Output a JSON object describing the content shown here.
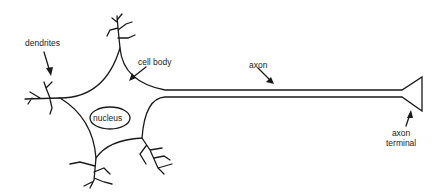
{
  "labels": {
    "dendrites": "dendrites",
    "cell_body": "cell body",
    "nucleus": "nucleus",
    "axon": "axon",
    "axon_terminal_1": "axon",
    "axon_terminal_2": "terminal"
  },
  "colors": {
    "stroke": "#1a1a1a",
    "background": "#ffffff"
  }
}
